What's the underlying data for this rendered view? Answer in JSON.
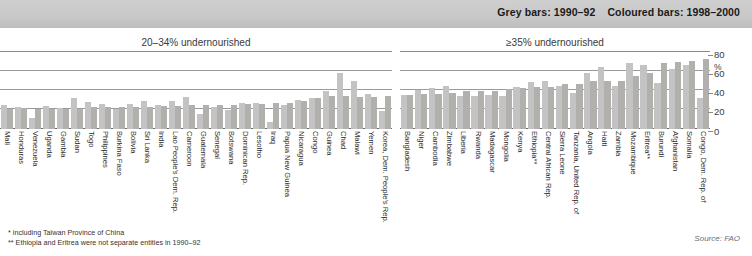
{
  "legend": {
    "grey_label": "Grey bars: 1990–92",
    "coloured_label": "Coloured bars: 1998–2000"
  },
  "axis": {
    "unit": "%",
    "ticks": [
      "80",
      "60",
      "40",
      "20",
      "0"
    ]
  },
  "footnotes": {
    "note1": "* including Taiwan Province of China",
    "note2": "** Ethiopia and Eritrea were not separate entities in 1990–92"
  },
  "source": "Source: FAO",
  "chart_data": {
    "type": "bar",
    "xlabel": "",
    "ylabel": "%",
    "ylim": [
      0,
      80
    ],
    "yticks": [
      0,
      20,
      40,
      60,
      80
    ],
    "grid": true,
    "legend_position": "top-right",
    "series_names": [
      "1990–92",
      "1998–2000"
    ],
    "series_colors": [
      "#c3c3c3",
      "#b2b0ac"
    ],
    "panels": [
      {
        "title": "20–34% undernourished",
        "categories": [
          "Mali",
          "Honduras",
          "Venezuela",
          "Uganda",
          "Gambia",
          "Sudan",
          "Togo",
          "Philippines",
          "Burkina Faso",
          "Bolivia",
          "Sri Lanka",
          "India",
          "Lao People's Dem. Rep.",
          "Cameroon",
          "Guatemala",
          "Senegal",
          "Botswana",
          "Dominican Rep.",
          "Lesotho",
          "Iraq",
          "Papua New Guinea",
          "Nicaragua",
          "Congo",
          "Guinea",
          "Chad",
          "Malawi",
          "Yemen",
          "Korea, Dem. People's Rep."
        ],
        "series": [
          {
            "name": "1990–92",
            "values": [
              25,
              23,
              11,
              24,
              22,
              32,
              28,
              26,
              21,
              26,
              29,
              25,
              29,
              33,
              16,
              23,
              20,
              27,
              27,
              7,
              25,
              30,
              32,
              39,
              58,
              50,
              36,
              19
            ]
          },
          {
            "name": "1998–2000",
            "values": [
              21,
              22,
              21,
              21,
              21,
              21,
              23,
              23,
              23,
              23,
              23,
              24,
              24,
              25,
              25,
              25,
              25,
              26,
              26,
              27,
              27,
              29,
              32,
              34,
              34,
              33,
              33,
              34
            ]
          }
        ]
      },
      {
        "title": "≥35% undernourished",
        "categories": [
          "Bangladesh",
          "Niger",
          "Cambodia",
          "Zimbabwe",
          "Liberia",
          "Rwanda",
          "Madagascar",
          "Mongolia",
          "Kenya",
          "Ethiopia**",
          "Central African Rep.",
          "Sierra Leone",
          "Tanzania, United Rep. of",
          "Angola",
          "Haiti",
          "Zambia",
          "Mozambique",
          "Eritrea**",
          "Burundi",
          "Afghanistan",
          "Somalia",
          "Congo, Dem. Rep. of"
        ],
        "series": [
          {
            "name": "1990–92",
            "values": [
              35,
              41,
              43,
              45,
              34,
              34,
              35,
              34,
              44,
              49,
              50,
              45,
              37,
              58,
              64,
              45,
              69,
              67,
              48,
              62,
              67,
              32
            ]
          },
          {
            "name": "1998–2000",
            "values": [
              35,
              36,
              36,
              37,
              39,
              40,
              40,
              42,
              43,
              44,
              44,
              47,
              47,
              50,
              50,
              50,
              55,
              58,
              69,
              70,
              71,
              73
            ]
          }
        ]
      }
    ]
  }
}
